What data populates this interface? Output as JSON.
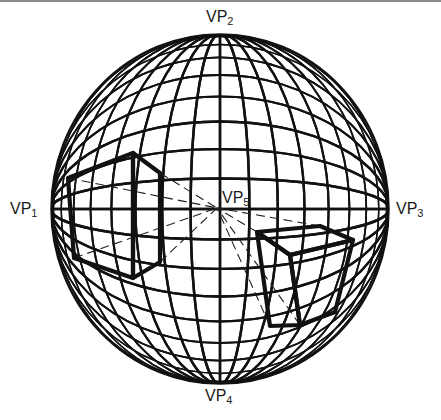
{
  "diagram": {
    "type": "curvilinear-perspective-sphere",
    "sphere": {
      "cx": 220,
      "cy": 209,
      "rx": 169,
      "ry": 175,
      "meridians": 36,
      "parallels": 36,
      "grid_color": "#111111"
    },
    "vanishing_points": [
      {
        "id": "vp1",
        "base": "VP",
        "sub": "1",
        "x": 10,
        "y": 200
      },
      {
        "id": "vp2",
        "base": "VP",
        "sub": "2",
        "x": 206,
        "y": 8
      },
      {
        "id": "vp3",
        "base": "VP",
        "sub": "3",
        "x": 396,
        "y": 200
      },
      {
        "id": "vp4",
        "base": "VP",
        "sub": "4",
        "x": 205,
        "y": 387
      },
      {
        "id": "vp5",
        "base": "VP",
        "sub": "5",
        "x": 222,
        "y": 189
      }
    ],
    "center_point": {
      "x": 217,
      "y": 208
    },
    "boxes": [
      {
        "name": "left-box",
        "front_face": [
          [
            68,
            178
          ],
          [
            133,
            153
          ],
          [
            133,
            278
          ],
          [
            74,
            258
          ]
        ],
        "side_face": [
          [
            133,
            153
          ],
          [
            160,
            173
          ],
          [
            160,
            262
          ],
          [
            133,
            278
          ]
        ]
      },
      {
        "name": "right-box",
        "top_face": [
          [
            257,
            232
          ],
          [
            320,
            226
          ],
          [
            353,
            240
          ],
          [
            290,
            255
          ]
        ],
        "front_face": [
          [
            257,
            232
          ],
          [
            290,
            255
          ],
          [
            300,
            325
          ],
          [
            270,
            326
          ]
        ],
        "side_face": [
          [
            290,
            255
          ],
          [
            353,
            240
          ],
          [
            335,
            312
          ],
          [
            300,
            325
          ]
        ]
      }
    ],
    "construction_lines_to_vp5": [
      [
        68,
        178
      ],
      [
        74,
        258
      ],
      [
        160,
        173
      ],
      [
        160,
        262
      ],
      [
        257,
        232
      ],
      [
        320,
        226
      ],
      [
        300,
        325
      ],
      [
        270,
        326
      ]
    ]
  }
}
